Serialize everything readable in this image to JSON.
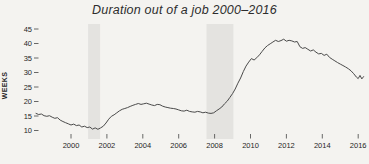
{
  "chart_data": {
    "type": "line",
    "title": "Duration out of a job 2000–2016",
    "xlabel": "",
    "ylabel": "WEEKS",
    "x_ticks": [
      2000,
      2002,
      2004,
      2006,
      2008,
      2010,
      2012,
      2014,
      2016
    ],
    "y_ticks": [
      10,
      15,
      20,
      25,
      30,
      35,
      40,
      45
    ],
    "xlim": [
      1998.0,
      2016.45
    ],
    "ylim": [
      6.5,
      47.5
    ],
    "grid": false,
    "legend": "none",
    "line_color": "#4a4a4a",
    "band_color": "#e4e3e0",
    "tick_color": "#444444",
    "background_color": "#f4f3f0",
    "recession_bands": [
      {
        "x0": 2000.95,
        "x1": 2001.62
      },
      {
        "x0": 2007.55,
        "x1": 2009.05
      }
    ],
    "series": [
      {
        "name": "Duration out of a job (weeks)",
        "points": [
          [
            1998.05,
            15.9
          ],
          [
            1998.2,
            15.5
          ],
          [
            1998.35,
            15.7
          ],
          [
            1998.5,
            15.1
          ],
          [
            1998.65,
            14.9
          ],
          [
            1998.8,
            15.1
          ],
          [
            1998.95,
            14.6
          ],
          [
            1999.1,
            14.2
          ],
          [
            1999.25,
            14.4
          ],
          [
            1999.4,
            13.6
          ],
          [
            1999.55,
            13.1
          ],
          [
            1999.7,
            12.7
          ],
          [
            1999.85,
            12.3
          ],
          [
            2000.0,
            11.9
          ],
          [
            2000.15,
            12.2
          ],
          [
            2000.3,
            11.7
          ],
          [
            2000.45,
            11.9
          ],
          [
            2000.6,
            11.2
          ],
          [
            2000.75,
            11.5
          ],
          [
            2000.9,
            11.0
          ],
          [
            2001.05,
            11.2
          ],
          [
            2001.2,
            10.5
          ],
          [
            2001.35,
            10.9
          ],
          [
            2001.5,
            10.4
          ],
          [
            2001.65,
            10.9
          ],
          [
            2001.8,
            11.5
          ],
          [
            2001.95,
            12.6
          ],
          [
            2002.1,
            13.9
          ],
          [
            2002.25,
            14.9
          ],
          [
            2002.4,
            15.4
          ],
          [
            2002.55,
            16.1
          ],
          [
            2002.7,
            16.8
          ],
          [
            2002.85,
            17.3
          ],
          [
            2003.0,
            17.6
          ],
          [
            2003.15,
            17.9
          ],
          [
            2003.3,
            18.3
          ],
          [
            2003.45,
            18.7
          ],
          [
            2003.6,
            19.0
          ],
          [
            2003.75,
            19.3
          ],
          [
            2003.9,
            19.0
          ],
          [
            2004.05,
            19.2
          ],
          [
            2004.2,
            19.4
          ],
          [
            2004.35,
            19.1
          ],
          [
            2004.5,
            18.8
          ],
          [
            2004.65,
            18.6
          ],
          [
            2004.8,
            19.0
          ],
          [
            2004.95,
            18.9
          ],
          [
            2005.1,
            18.4
          ],
          [
            2005.25,
            18.1
          ],
          [
            2005.4,
            17.9
          ],
          [
            2005.55,
            17.7
          ],
          [
            2005.7,
            17.6
          ],
          [
            2005.85,
            17.4
          ],
          [
            2006.0,
            17.1
          ],
          [
            2006.15,
            16.8
          ],
          [
            2006.3,
            16.7
          ],
          [
            2006.45,
            17.0
          ],
          [
            2006.6,
            16.6
          ],
          [
            2006.75,
            16.4
          ],
          [
            2006.9,
            16.3
          ],
          [
            2007.05,
            16.6
          ],
          [
            2007.2,
            16.4
          ],
          [
            2007.35,
            16.1
          ],
          [
            2007.5,
            16.3
          ],
          [
            2007.65,
            16.0
          ],
          [
            2007.8,
            15.9
          ],
          [
            2007.95,
            16.1
          ],
          [
            2008.1,
            16.8
          ],
          [
            2008.25,
            17.4
          ],
          [
            2008.4,
            18.1
          ],
          [
            2008.55,
            19.2
          ],
          [
            2008.7,
            20.1
          ],
          [
            2008.85,
            21.4
          ],
          [
            2009.0,
            22.7
          ],
          [
            2009.15,
            24.3
          ],
          [
            2009.3,
            26.3
          ],
          [
            2009.45,
            28.1
          ],
          [
            2009.6,
            30.3
          ],
          [
            2009.75,
            32.2
          ],
          [
            2009.9,
            33.6
          ],
          [
            2010.05,
            34.8
          ],
          [
            2010.2,
            34.3
          ],
          [
            2010.35,
            35.1
          ],
          [
            2010.5,
            36.1
          ],
          [
            2010.65,
            37.3
          ],
          [
            2010.8,
            38.5
          ],
          [
            2010.95,
            39.3
          ],
          [
            2011.1,
            39.9
          ],
          [
            2011.25,
            40.5
          ],
          [
            2011.4,
            41.1
          ],
          [
            2011.55,
            40.7
          ],
          [
            2011.7,
            41.0
          ],
          [
            2011.85,
            41.5
          ],
          [
            2012.0,
            40.8
          ],
          [
            2012.15,
            41.1
          ],
          [
            2012.3,
            40.9
          ],
          [
            2012.45,
            40.5
          ],
          [
            2012.6,
            40.7
          ],
          [
            2012.75,
            38.9
          ],
          [
            2012.9,
            38.3
          ],
          [
            2013.05,
            38.6
          ],
          [
            2013.2,
            38.0
          ],
          [
            2013.35,
            37.4
          ],
          [
            2013.5,
            37.8
          ],
          [
            2013.65,
            37.0
          ],
          [
            2013.8,
            36.4
          ],
          [
            2013.95,
            36.6
          ],
          [
            2014.1,
            35.9
          ],
          [
            2014.25,
            36.3
          ],
          [
            2014.4,
            35.2
          ],
          [
            2014.55,
            34.6
          ],
          [
            2014.7,
            34.0
          ],
          [
            2014.85,
            33.4
          ],
          [
            2015.0,
            32.9
          ],
          [
            2015.15,
            32.4
          ],
          [
            2015.3,
            31.9
          ],
          [
            2015.45,
            31.3
          ],
          [
            2015.6,
            30.6
          ],
          [
            2015.75,
            29.6
          ],
          [
            2015.9,
            28.4
          ],
          [
            2016.0,
            27.9
          ],
          [
            2016.1,
            29.0
          ],
          [
            2016.2,
            27.8
          ],
          [
            2016.3,
            28.6
          ]
        ]
      }
    ]
  }
}
